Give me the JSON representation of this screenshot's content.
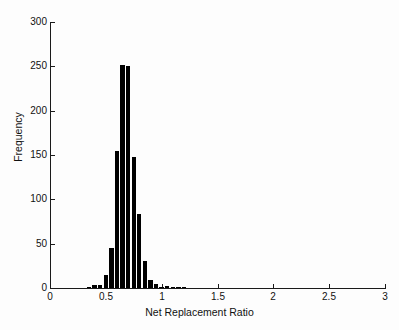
{
  "chart_data": {
    "type": "bar",
    "title": "",
    "subtitle": "",
    "xlabel": "Net Replacement Ratio",
    "ylabel": "Frequency",
    "xlim": [
      0,
      3
    ],
    "ylim": [
      0,
      300
    ],
    "xticks": [
      "0",
      "0.5",
      "1",
      "1.5",
      "2",
      "2.5",
      "3"
    ],
    "xtick_values": [
      0,
      0.5,
      1,
      1.5,
      2,
      2.5,
      3
    ],
    "yticks": [
      "0",
      "50",
      "100",
      "150",
      "200",
      "250",
      "300"
    ],
    "ytick_values": [
      0,
      50,
      100,
      150,
      200,
      250,
      300
    ],
    "grid": false,
    "legend": false,
    "bar_color": "#000000",
    "bin_width": 0.05,
    "categories": [
      0.35,
      0.4,
      0.45,
      0.5,
      0.55,
      0.6,
      0.65,
      0.7,
      0.75,
      0.8,
      0.85,
      0.9,
      0.95,
      1.0,
      1.05,
      1.1,
      1.15,
      1.2,
      1.25
    ],
    "values": [
      1,
      3,
      3,
      15,
      45,
      155,
      252,
      250,
      148,
      83,
      31,
      9,
      4,
      1,
      2,
      1,
      1,
      1,
      0
    ],
    "series": [
      {
        "name": "Net Replacement Ratio",
        "values": [
          1,
          3,
          3,
          15,
          45,
          155,
          252,
          250,
          148,
          83,
          31,
          9,
          4,
          1,
          2,
          1,
          1,
          1,
          0
        ]
      }
    ]
  },
  "figure": {
    "background_color": "#ffffff",
    "axis_color": "#1a1a1a",
    "text_color": "#111111"
  }
}
